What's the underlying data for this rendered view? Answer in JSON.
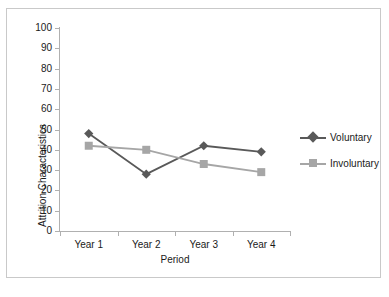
{
  "chart_data": {
    "type": "line",
    "title": "",
    "xlabel": "Period",
    "ylabel": "Attrition Characteristics",
    "categories": [
      "Year 1",
      "Year 2",
      "Year 3",
      "Year 4"
    ],
    "ylim": [
      0,
      100
    ],
    "yticks": [
      100,
      90,
      80,
      70,
      60,
      50,
      40,
      30,
      20,
      10,
      0
    ],
    "grid": false,
    "legend_position": "right",
    "series": [
      {
        "name": "Voluntary",
        "values": [
          48,
          28,
          42,
          39
        ],
        "color": "#595959",
        "marker": "diamond"
      },
      {
        "name": "Involuntary",
        "values": [
          42,
          40,
          33,
          29
        ],
        "color": "#a6a6a6",
        "marker": "square"
      }
    ]
  },
  "axes": {
    "y_title": "Attrition Characteristics",
    "x_title": "Period"
  },
  "colors": {
    "voluntary": "#595959",
    "involuntary": "#a6a6a6",
    "axis": "#b0b0b0",
    "frame": "#c9c9c9",
    "text": "#1a1a1a"
  }
}
